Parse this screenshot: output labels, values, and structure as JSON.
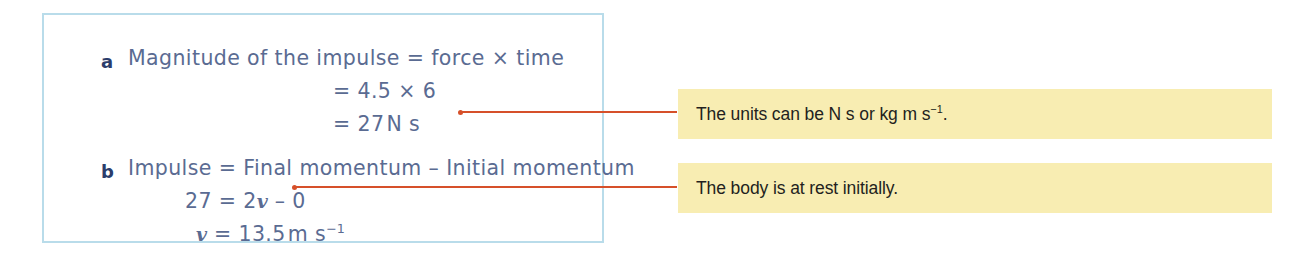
{
  "solution": {
    "part_a": {
      "label": "a",
      "line1": "Magnitude of the impulse = force × time",
      "line2": "= 4.5 × 6",
      "line3_prefix": "= 27",
      "line3_units": "N s"
    },
    "part_b": {
      "label": "b",
      "line1": "Impulse = Final momentum – Initial momentum",
      "line2_lhs": "27 = 2",
      "line2_var": "v",
      "line2_rhs": " – 0",
      "line3_var": "v",
      "line3_value": " = 13.5",
      "line3_units": "m s",
      "line3_exponent": "−1"
    }
  },
  "notes": [
    {
      "text_before": "The units can be N s or kg m s",
      "exponent": "−1",
      "text_after": "."
    },
    {
      "text_before": "The body is at rest initially.",
      "exponent": "",
      "text_after": ""
    }
  ],
  "colors": {
    "box_border": "#b9dcea",
    "solution_text": "#5a6b92",
    "part_label": "#2b3d6b",
    "connector": "#d6502a",
    "note_background": "#f8edb2",
    "note_text": "#231f20"
  }
}
